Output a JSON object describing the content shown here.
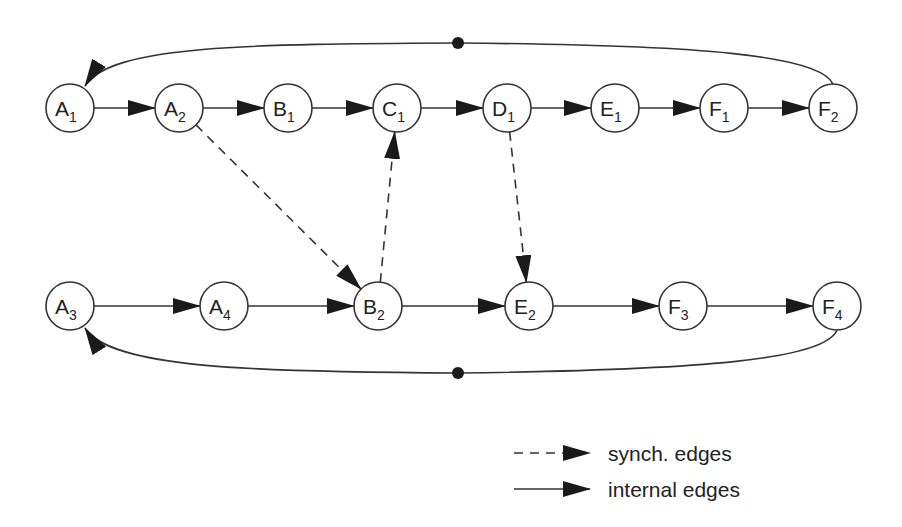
{
  "diagram": {
    "nodes": [
      {
        "id": "A1",
        "letter": "A",
        "index": "1",
        "row": "top"
      },
      {
        "id": "A2",
        "letter": "A",
        "index": "2",
        "row": "top"
      },
      {
        "id": "B1",
        "letter": "B",
        "index": "1",
        "row": "top"
      },
      {
        "id": "C1",
        "letter": "C",
        "index": "1",
        "row": "top"
      },
      {
        "id": "D1",
        "letter": "D",
        "index": "1",
        "row": "top"
      },
      {
        "id": "E1",
        "letter": "E",
        "index": "1",
        "row": "top"
      },
      {
        "id": "F1",
        "letter": "F",
        "index": "1",
        "row": "top"
      },
      {
        "id": "F2",
        "letter": "F",
        "index": "2",
        "row": "top"
      },
      {
        "id": "A3",
        "letter": "A",
        "index": "3",
        "row": "bottom"
      },
      {
        "id": "A4",
        "letter": "A",
        "index": "4",
        "row": "bottom"
      },
      {
        "id": "B2",
        "letter": "B",
        "index": "2",
        "row": "bottom"
      },
      {
        "id": "E2",
        "letter": "E",
        "index": "2",
        "row": "bottom"
      },
      {
        "id": "F3",
        "letter": "F",
        "index": "3",
        "row": "bottom"
      },
      {
        "id": "F4",
        "letter": "F",
        "index": "4",
        "row": "bottom"
      }
    ],
    "internal_edges": [
      [
        "A1",
        "A2"
      ],
      [
        "A2",
        "B1"
      ],
      [
        "B1",
        "C1"
      ],
      [
        "C1",
        "D1"
      ],
      [
        "D1",
        "E1"
      ],
      [
        "E1",
        "F1"
      ],
      [
        "F1",
        "F2"
      ],
      [
        "A3",
        "A4"
      ],
      [
        "A4",
        "B2"
      ],
      [
        "B2",
        "E2"
      ],
      [
        "E2",
        "F3"
      ],
      [
        "F3",
        "F4"
      ]
    ],
    "loop_edges": [
      {
        "from": "F2",
        "to": "A1",
        "has_token": true
      },
      {
        "from": "F4",
        "to": "A3",
        "has_token": true
      }
    ],
    "synch_edges": [
      [
        "A2",
        "B2"
      ],
      [
        "B2",
        "C1"
      ],
      [
        "D1",
        "E2"
      ]
    ],
    "legend": [
      {
        "style": "dashed",
        "label": "synch. edges"
      },
      {
        "style": "solid",
        "label": "internal edges"
      }
    ],
    "colors": {
      "stroke": "#333333",
      "fill": "#ffffff",
      "text": "#222222"
    }
  }
}
